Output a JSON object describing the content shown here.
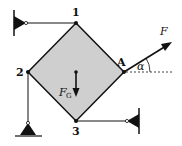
{
  "diagram": {
    "type": "statics-free-body",
    "colors": {
      "plate_fill": "#cfcfcf",
      "line": "#111111",
      "background": "#ffffff"
    },
    "nodes": [
      {
        "id": "1",
        "label": "1",
        "x": 76,
        "y": 23
      },
      {
        "id": "2",
        "label": "2",
        "x": 28,
        "y": 72
      },
      {
        "id": "A",
        "label": "A",
        "x": 124,
        "y": 72
      },
      {
        "id": "3",
        "label": "3",
        "x": 76,
        "y": 121
      }
    ],
    "supports": [
      {
        "name": "support-1",
        "kind": "wall-hinge-left",
        "attached_to": "1"
      },
      {
        "name": "support-2",
        "kind": "ground-pin-bottom",
        "attached_to": "2"
      },
      {
        "name": "support-3",
        "kind": "wall-hinge-right",
        "attached_to": "3"
      }
    ],
    "forces": [
      {
        "name": "weight",
        "label": "F",
        "subscript": "G",
        "direction": "down"
      },
      {
        "name": "applied-force",
        "label": "F",
        "subscript": "",
        "direction": "up-right",
        "angle_label": "α"
      }
    ]
  }
}
